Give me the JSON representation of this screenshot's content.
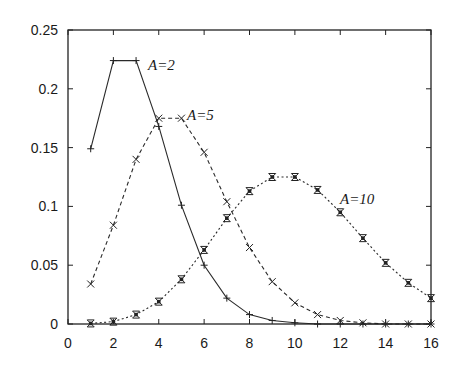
{
  "chart_data": {
    "type": "line",
    "title": "",
    "xlabel": "",
    "ylabel": "",
    "xlim": [
      0,
      16
    ],
    "ylim": [
      0,
      0.25
    ],
    "grid": false,
    "legend_position": "inline labels next to curves",
    "x_ticks": [
      0,
      2,
      4,
      6,
      8,
      10,
      12,
      14,
      16
    ],
    "x_tick_labels": [
      "0",
      "2",
      "4",
      "6",
      "8",
      "10",
      "12",
      "14",
      "16"
    ],
    "y_ticks": [
      0,
      0.05,
      0.1,
      0.15,
      0.2,
      0.25
    ],
    "y_tick_labels": [
      "0",
      "0.05",
      "0.1",
      "0.15",
      "0.2",
      "0.25"
    ],
    "x": [
      1,
      2,
      3,
      4,
      5,
      6,
      7,
      8,
      9,
      10,
      11,
      12,
      13,
      14,
      15,
      16
    ],
    "series": [
      {
        "name": "A=2",
        "line_style": "solid",
        "marker": "plus",
        "values": [
          0.149,
          0.224,
          0.224,
          0.168,
          0.101,
          0.05,
          0.022,
          0.008,
          0.003,
          0.001,
          0.0,
          0.0,
          0.0,
          0.0,
          0.0,
          0.0
        ],
        "label_pos": [
          148,
          70
        ]
      },
      {
        "name": "A=5",
        "line_style": "dashed",
        "marker": "cross",
        "values": [
          0.034,
          0.084,
          0.14,
          0.175,
          0.175,
          0.146,
          0.104,
          0.065,
          0.036,
          0.018,
          0.008,
          0.003,
          0.001,
          0.0,
          0.0,
          0.0
        ],
        "label_pos": [
          187,
          120
        ]
      },
      {
        "name": "A=10",
        "line_style": "dotted",
        "marker": "asterisk",
        "values": [
          0.0005,
          0.002,
          0.008,
          0.019,
          0.038,
          0.063,
          0.09,
          0.113,
          0.125,
          0.125,
          0.114,
          0.095,
          0.073,
          0.052,
          0.035,
          0.022
        ],
        "label_pos": [
          340,
          204
        ]
      }
    ]
  },
  "plot_area": {
    "left": 68,
    "top": 30,
    "right": 431,
    "bottom": 324
  }
}
